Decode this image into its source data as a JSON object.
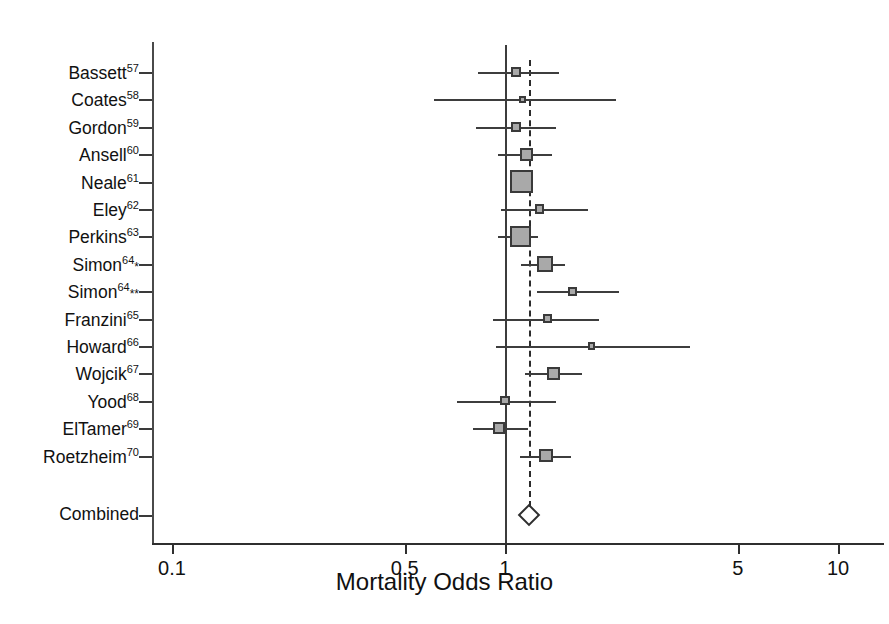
{
  "chart_data": {
    "type": "forest",
    "title": "",
    "xlabel": "Mortality Odds Ratio",
    "ylabel": "",
    "scale": "log",
    "xlim": [
      0.1,
      10
    ],
    "ticks": [
      "0.1",
      "0.5",
      "1",
      "5",
      "10"
    ],
    "tick_values": [
      0.1,
      0.5,
      1,
      5,
      10
    ],
    "reference_line": 1,
    "pooled_line": 1.18,
    "grid": false,
    "legend": "none",
    "studies": [
      {
        "label": "Bassett",
        "ref": "57",
        "stars": "",
        "or": 1.08,
        "low": 0.83,
        "high": 1.45,
        "weight": 0.18
      },
      {
        "label": "Coates",
        "ref": "58",
        "stars": "",
        "or": 1.13,
        "low": 0.61,
        "high": 2.16,
        "weight": 0.05
      },
      {
        "label": "Gordon",
        "ref": "59",
        "stars": "",
        "or": 1.08,
        "low": 0.82,
        "high": 1.42,
        "weight": 0.18
      },
      {
        "label": "Ansell",
        "ref": "60",
        "stars": "",
        "or": 1.16,
        "low": 0.95,
        "high": 1.38,
        "weight": 0.3
      },
      {
        "label": "Neale",
        "ref": "61",
        "stars": "",
        "or": 1.12,
        "low": 1.04,
        "high": 1.21,
        "weight": 0.72
      },
      {
        "label": "Eley",
        "ref": "62",
        "stars": "",
        "or": 1.27,
        "low": 0.97,
        "high": 1.77,
        "weight": 0.15
      },
      {
        "label": "Perkins",
        "ref": "63",
        "stars": "",
        "or": 1.11,
        "low": 0.95,
        "high": 1.26,
        "weight": 0.66
      },
      {
        "label": "Simon",
        "ref": "64",
        "stars": "*",
        "or": 1.32,
        "low": 1.12,
        "high": 1.51,
        "weight": 0.44
      },
      {
        "label": "Simon",
        "ref": "64",
        "stars": "**",
        "or": 1.6,
        "low": 1.25,
        "high": 2.2,
        "weight": 0.13
      },
      {
        "label": "Franzini",
        "ref": "65",
        "stars": "",
        "or": 1.34,
        "low": 0.92,
        "high": 1.92,
        "weight": 0.14
      },
      {
        "label": "Howard",
        "ref": "66",
        "stars": "",
        "or": 1.82,
        "low": 0.94,
        "high": 3.6,
        "weight": 0.05
      },
      {
        "label": "Wojcik",
        "ref": "67",
        "stars": "",
        "or": 1.4,
        "low": 1.15,
        "high": 1.7,
        "weight": 0.32
      },
      {
        "label": "Yood",
        "ref": "68",
        "stars": "",
        "or": 1.0,
        "low": 0.72,
        "high": 1.42,
        "weight": 0.14
      },
      {
        "label": "ElTamer",
        "ref": "69",
        "stars": "",
        "or": 0.96,
        "low": 0.8,
        "high": 1.17,
        "weight": 0.26
      },
      {
        "label": "Roetzheim",
        "ref": "70",
        "stars": "",
        "or": 1.33,
        "low": 1.11,
        "high": 1.58,
        "weight": 0.33
      }
    ],
    "combined": {
      "label": "Combined",
      "or": 1.18,
      "low": 1.11,
      "high": 1.26,
      "marker": "diamond"
    }
  },
  "colors": {
    "box_fill": "#a9a9a9",
    "box_border": "#3a3a3a",
    "line": "#3d3d3d",
    "axis": "#2f2f2f",
    "text": "#111111"
  }
}
